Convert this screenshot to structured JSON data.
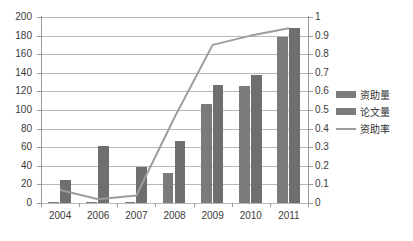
{
  "chart_data": {
    "type": "bar",
    "title": "",
    "subtitle": "",
    "xlabel": "",
    "ylabel": "",
    "ylabel_right": "",
    "categories": [
      "2004",
      "2006",
      "2007",
      "2008",
      "2009",
      "2010",
      "2011"
    ],
    "series": [
      {
        "name": "资助量",
        "type": "bar",
        "axis": "left",
        "color": "#7b7b7b",
        "values": [
          1,
          1,
          1,
          32,
          106,
          126,
          179
        ]
      },
      {
        "name": "论文量",
        "type": "bar",
        "axis": "left",
        "color": "#6f6f6f",
        "values": [
          25,
          61,
          39,
          67,
          127,
          138,
          188
        ]
      },
      {
        "name": "资助率",
        "type": "line",
        "axis": "right",
        "color": "#9d9d9d",
        "values": [
          0.07,
          0.02,
          0.04,
          0.46,
          0.85,
          0.9,
          0.94
        ]
      }
    ],
    "ylim": [
      0,
      200
    ],
    "ytick_step": 20,
    "yticks_left": [
      "0",
      "20",
      "40",
      "60",
      "80",
      "100",
      "120",
      "140",
      "160",
      "180",
      "200"
    ],
    "ylim_right": [
      0,
      1
    ],
    "ytick_step_right": 0.1,
    "yticks_right": [
      "0",
      "0.1",
      "0.2",
      "0.3",
      "0.4",
      "0.5",
      "0.6",
      "0.7",
      "0.8",
      "0.9",
      "1"
    ],
    "grid": true,
    "legend_position": "right"
  },
  "legend": {
    "items": [
      {
        "label": "资助量",
        "marker": "bar-swatch"
      },
      {
        "label": "论文量",
        "marker": "bar-swatch"
      },
      {
        "label": "资助率",
        "marker": "line-swatch"
      }
    ]
  },
  "colors": {
    "bar_series_a": "#7b7b7b",
    "bar_series_b": "#6f6f6f",
    "line": "#9d9d9d",
    "gridline": "#b8b8b8",
    "axis": "#9a9a9a",
    "text": "#3a3a3a",
    "background": "#ffffff"
  }
}
